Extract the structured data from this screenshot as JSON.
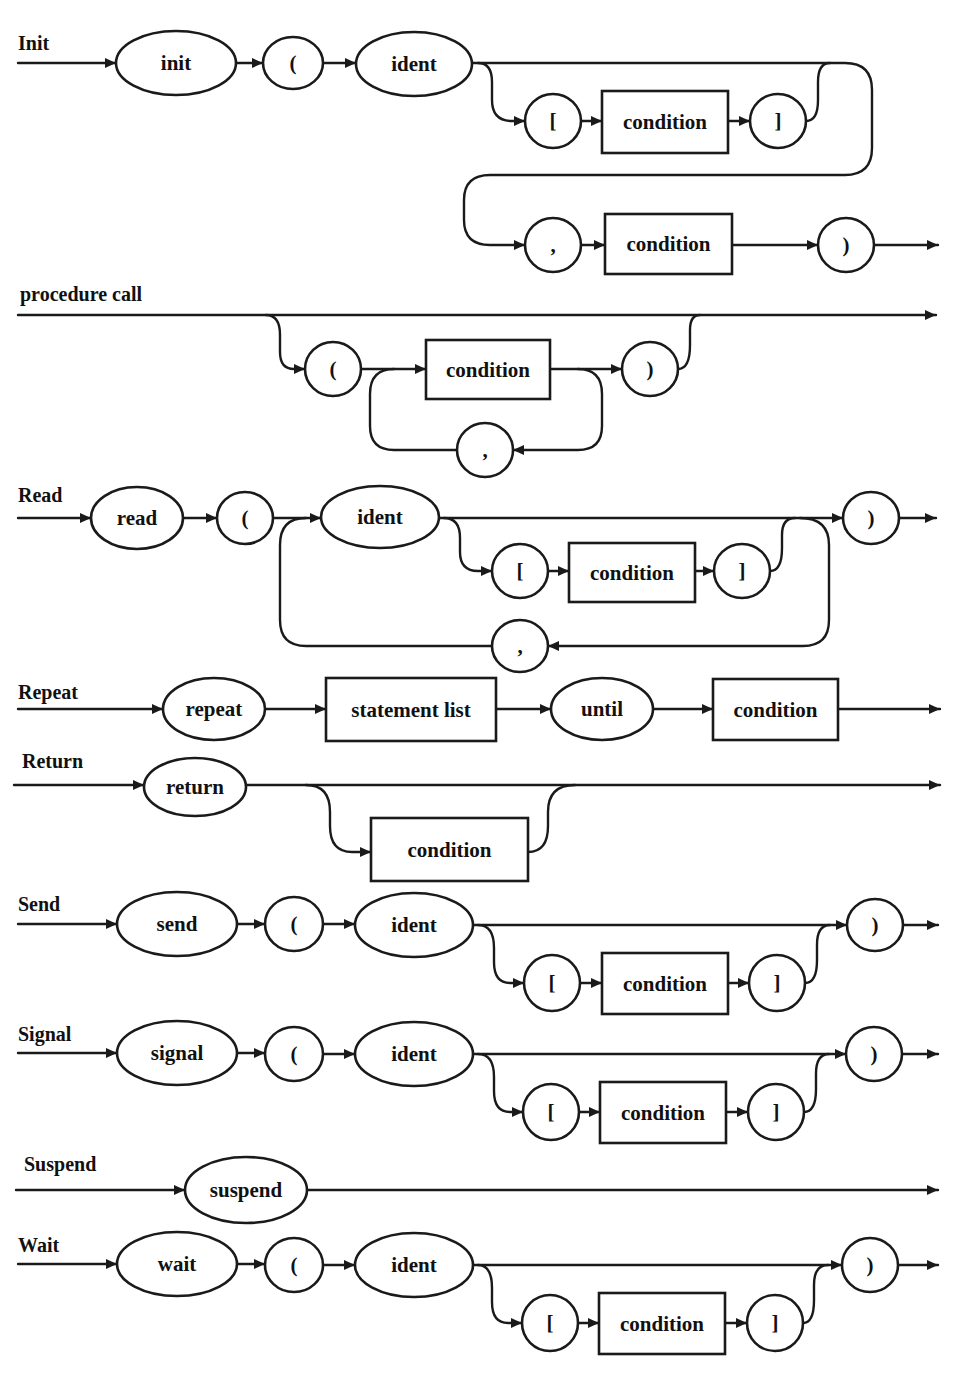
{
  "diagram": {
    "title": "Syntax diagrams for statements",
    "colors": {
      "ink": "#1a1a1a",
      "background": "#ffffff"
    },
    "rules": [
      {
        "id": "init",
        "title": "Init",
        "title_pos": [
          18,
          50
        ]
      },
      {
        "id": "procedure-call",
        "title": "procedure call",
        "title_pos": [
          20,
          301
        ]
      },
      {
        "id": "read",
        "title": "Read",
        "title_pos": [
          18,
          502
        ]
      },
      {
        "id": "repeat",
        "title": "Repeat",
        "title_pos": [
          18,
          699
        ]
      },
      {
        "id": "return",
        "title": "Return",
        "title_pos": [
          22,
          768
        ]
      },
      {
        "id": "send",
        "title": "Send",
        "title_pos": [
          18,
          911
        ]
      },
      {
        "id": "signal",
        "title": "Signal",
        "title_pos": [
          18,
          1041
        ]
      },
      {
        "id": "suspend",
        "title": "Suspend",
        "title_pos": [
          24,
          1171
        ]
      },
      {
        "id": "wait",
        "title": "Wait",
        "title_pos": [
          18,
          1252
        ]
      }
    ],
    "nodes": [
      {
        "rule": "init",
        "kind": "terminal",
        "label": "init",
        "cx": 176,
        "cy": 63,
        "rx": 60,
        "ry": 32
      },
      {
        "rule": "init",
        "kind": "terminal",
        "label": "(",
        "cx": 293,
        "cy": 63,
        "rx": 30,
        "ry": 26
      },
      {
        "rule": "init",
        "kind": "terminal",
        "label": "ident",
        "cx": 414,
        "cy": 64,
        "rx": 58,
        "ry": 32
      },
      {
        "rule": "init",
        "kind": "terminal",
        "label": "[",
        "cx": 553,
        "cy": 121,
        "rx": 28,
        "ry": 27
      },
      {
        "rule": "init",
        "kind": "nonterminal",
        "label": "condition",
        "x": 602,
        "y": 91,
        "w": 126,
        "h": 62
      },
      {
        "rule": "init",
        "kind": "terminal",
        "label": "]",
        "cx": 778,
        "cy": 121,
        "rx": 28,
        "ry": 27
      },
      {
        "rule": "init",
        "kind": "terminal",
        "label": ",",
        "cx": 553,
        "cy": 245,
        "rx": 28,
        "ry": 27
      },
      {
        "rule": "init",
        "kind": "nonterminal",
        "label": "condition",
        "x": 605,
        "y": 214,
        "w": 127,
        "h": 60
      },
      {
        "rule": "init",
        "kind": "terminal",
        "label": ")",
        "cx": 846,
        "cy": 245,
        "rx": 28,
        "ry": 27
      },
      {
        "rule": "procedure-call",
        "kind": "terminal",
        "label": "(",
        "cx": 333,
        "cy": 369,
        "rx": 28,
        "ry": 27
      },
      {
        "rule": "procedure-call",
        "kind": "nonterminal",
        "label": "condition",
        "x": 426,
        "y": 340,
        "w": 124,
        "h": 59
      },
      {
        "rule": "procedure-call",
        "kind": "terminal",
        "label": ")",
        "cx": 650,
        "cy": 369,
        "rx": 28,
        "ry": 27
      },
      {
        "rule": "procedure-call",
        "kind": "terminal",
        "label": ",",
        "cx": 485,
        "cy": 450,
        "rx": 28,
        "ry": 27
      },
      {
        "rule": "read",
        "kind": "terminal",
        "label": "read",
        "cx": 137,
        "cy": 518,
        "rx": 46,
        "ry": 31
      },
      {
        "rule": "read",
        "kind": "terminal",
        "label": "(",
        "cx": 245,
        "cy": 518,
        "rx": 28,
        "ry": 26
      },
      {
        "rule": "read",
        "kind": "terminal",
        "label": "ident",
        "cx": 380,
        "cy": 517,
        "rx": 59,
        "ry": 31
      },
      {
        "rule": "read",
        "kind": "terminal",
        "label": "[",
        "cx": 520,
        "cy": 571,
        "rx": 28,
        "ry": 27
      },
      {
        "rule": "read",
        "kind": "nonterminal",
        "label": "condition",
        "x": 569,
        "y": 543,
        "w": 126,
        "h": 59
      },
      {
        "rule": "read",
        "kind": "terminal",
        "label": "]",
        "cx": 742,
        "cy": 571,
        "rx": 28,
        "ry": 27
      },
      {
        "rule": "read",
        "kind": "terminal",
        "label": ",",
        "cx": 520,
        "cy": 646,
        "rx": 28,
        "ry": 26
      },
      {
        "rule": "read",
        "kind": "terminal",
        "label": ")",
        "cx": 871,
        "cy": 518,
        "rx": 28,
        "ry": 26
      },
      {
        "rule": "repeat",
        "kind": "terminal",
        "label": "repeat",
        "cx": 214,
        "cy": 709,
        "rx": 51,
        "ry": 31
      },
      {
        "rule": "repeat",
        "kind": "nonterminal",
        "label": "statement list",
        "x": 326,
        "y": 678,
        "w": 170,
        "h": 63
      },
      {
        "rule": "repeat",
        "kind": "terminal",
        "label": "until",
        "cx": 602,
        "cy": 709,
        "rx": 51,
        "ry": 31
      },
      {
        "rule": "repeat",
        "kind": "nonterminal",
        "label": "condition",
        "x": 713,
        "y": 679,
        "w": 125,
        "h": 61
      },
      {
        "rule": "return",
        "kind": "terminal",
        "label": "return",
        "cx": 195,
        "cy": 787,
        "rx": 51,
        "ry": 29
      },
      {
        "rule": "return",
        "kind": "nonterminal",
        "label": "condition",
        "x": 371,
        "y": 818,
        "w": 157,
        "h": 63
      },
      {
        "rule": "send",
        "kind": "terminal",
        "label": "send",
        "cx": 177,
        "cy": 924,
        "rx": 60,
        "ry": 32
      },
      {
        "rule": "send",
        "kind": "terminal",
        "label": "(",
        "cx": 294,
        "cy": 924,
        "rx": 29,
        "ry": 27
      },
      {
        "rule": "send",
        "kind": "terminal",
        "label": "ident",
        "cx": 414,
        "cy": 925,
        "rx": 59,
        "ry": 32
      },
      {
        "rule": "send",
        "kind": "terminal",
        "label": "[",
        "cx": 552,
        "cy": 983,
        "rx": 28,
        "ry": 28
      },
      {
        "rule": "send",
        "kind": "nonterminal",
        "label": "condition",
        "x": 602,
        "y": 953,
        "w": 126,
        "h": 61
      },
      {
        "rule": "send",
        "kind": "terminal",
        "label": "]",
        "cx": 777,
        "cy": 983,
        "rx": 28,
        "ry": 28
      },
      {
        "rule": "send",
        "kind": "terminal",
        "label": ")",
        "cx": 875,
        "cy": 925,
        "rx": 28,
        "ry": 26
      },
      {
        "rule": "signal",
        "kind": "terminal",
        "label": "signal",
        "cx": 177,
        "cy": 1053,
        "rx": 60,
        "ry": 32
      },
      {
        "rule": "signal",
        "kind": "terminal",
        "label": "(",
        "cx": 294,
        "cy": 1054,
        "rx": 29,
        "ry": 27
      },
      {
        "rule": "signal",
        "kind": "terminal",
        "label": "ident",
        "cx": 414,
        "cy": 1054,
        "rx": 59,
        "ry": 32
      },
      {
        "rule": "signal",
        "kind": "terminal",
        "label": "[",
        "cx": 551,
        "cy": 1112,
        "rx": 28,
        "ry": 28
      },
      {
        "rule": "signal",
        "kind": "nonterminal",
        "label": "condition",
        "x": 600,
        "y": 1082,
        "w": 126,
        "h": 61
      },
      {
        "rule": "signal",
        "kind": "terminal",
        "label": "]",
        "cx": 776,
        "cy": 1112,
        "rx": 28,
        "ry": 28
      },
      {
        "rule": "signal",
        "kind": "terminal",
        "label": ")",
        "cx": 874,
        "cy": 1054,
        "rx": 28,
        "ry": 27
      },
      {
        "rule": "suspend",
        "kind": "terminal",
        "label": "suspend",
        "cx": 246,
        "cy": 1190,
        "rx": 61,
        "ry": 33
      },
      {
        "rule": "wait",
        "kind": "terminal",
        "label": "wait",
        "cx": 177,
        "cy": 1264,
        "rx": 60,
        "ry": 32
      },
      {
        "rule": "wait",
        "kind": "terminal",
        "label": "(",
        "cx": 294,
        "cy": 1265,
        "rx": 29,
        "ry": 27
      },
      {
        "rule": "wait",
        "kind": "terminal",
        "label": "ident",
        "cx": 414,
        "cy": 1265,
        "rx": 59,
        "ry": 32
      },
      {
        "rule": "wait",
        "kind": "terminal",
        "label": "[",
        "cx": 550,
        "cy": 1323,
        "rx": 28,
        "ry": 28
      },
      {
        "rule": "wait",
        "kind": "nonterminal",
        "label": "condition",
        "x": 599,
        "y": 1293,
        "w": 126,
        "h": 61
      },
      {
        "rule": "wait",
        "kind": "terminal",
        "label": "]",
        "cx": 775,
        "cy": 1323,
        "rx": 28,
        "ry": 28
      },
      {
        "rule": "wait",
        "kind": "terminal",
        "label": ")",
        "cx": 870,
        "cy": 1265,
        "rx": 28,
        "ry": 27
      }
    ],
    "paths": [
      {
        "rule": "init",
        "d": "M18 63 L116 63",
        "arrow": [
          116,
          63,
          "r"
        ]
      },
      {
        "rule": "init",
        "d": "M236 63 L263 63",
        "arrow": [
          263,
          63,
          "r"
        ]
      },
      {
        "rule": "init",
        "d": "M323 63 L356 63",
        "arrow": [
          356,
          63,
          "r"
        ]
      },
      {
        "rule": "init",
        "d": "M472 63 L845 63 Q872 63 872 90 L872 148 Q872 175 845 175 L490 175 Q464 175 464 200 L464 220 Q464 245 490 245 L525 245",
        "arrow": [
          525,
          245,
          "r"
        ]
      },
      {
        "rule": "init",
        "d": "M478 63 Q492 63 492 82 L492 100 Q492 121 512 121 L525 121",
        "arrow": [
          525,
          121,
          "r"
        ]
      },
      {
        "rule": "init",
        "d": "M581 121 L602 121",
        "arrow": [
          602,
          121,
          "r"
        ]
      },
      {
        "rule": "init",
        "d": "M728 121 L750 121",
        "arrow": [
          750,
          121,
          "r"
        ]
      },
      {
        "rule": "init",
        "d": "M806 121 Q818 121 818 100 L818 82 Q818 63 830 63"
      },
      {
        "rule": "init",
        "d": "M581 245 L605 245",
        "arrow": [
          605,
          245,
          "r"
        ]
      },
      {
        "rule": "init",
        "d": "M732 245 L818 245",
        "arrow": [
          818,
          245,
          "r"
        ]
      },
      {
        "rule": "init",
        "d": "M874 245 L938 245",
        "arrow": [
          938,
          245,
          "r"
        ]
      },
      {
        "rule": "procedure-call",
        "d": "M18 315 L936 315",
        "arrow": [
          936,
          315,
          "r"
        ]
      },
      {
        "rule": "procedure-call",
        "d": "M266 315 Q280 315 280 335 L280 352 Q280 369 294 369 L305 369",
        "arrow": [
          305,
          369,
          "r"
        ]
      },
      {
        "rule": "procedure-call",
        "d": "M361 369 L426 369",
        "arrow": [
          426,
          369,
          "r"
        ]
      },
      {
        "rule": "procedure-call",
        "d": "M394 369 Q370 369 370 394 L370 426 Q370 450 394 450 L457 450"
      },
      {
        "rule": "procedure-call",
        "d": "M550 369 L622 369",
        "arrow": [
          622,
          369,
          "r"
        ]
      },
      {
        "rule": "procedure-call",
        "d": "M578 369 Q602 369 602 394 L602 426 Q602 450 578 450 L513 450",
        "arrow": [
          513,
          450,
          "l"
        ]
      },
      {
        "rule": "procedure-call",
        "d": "M678 369 Q690 369 690 345 L690 330 Q690 315 700 315"
      },
      {
        "rule": "read",
        "d": "M18 518 L91 518",
        "arrow": [
          91,
          518,
          "r"
        ]
      },
      {
        "rule": "read",
        "d": "M183 518 L217 518",
        "arrow": [
          217,
          518,
          "r"
        ]
      },
      {
        "rule": "read",
        "d": "M273 518 L321 518",
        "arrow": [
          321,
          518,
          "r"
        ]
      },
      {
        "rule": "read",
        "d": "M439 518 L843 518",
        "arrow": [
          843,
          518,
          "r"
        ]
      },
      {
        "rule": "read",
        "d": "M444 518 Q460 518 460 538 L460 552 Q460 571 478 571 L492 571",
        "arrow": [
          492,
          571,
          "r"
        ]
      },
      {
        "rule": "read",
        "d": "M548 571 L569 571",
        "arrow": [
          569,
          571,
          "r"
        ]
      },
      {
        "rule": "read",
        "d": "M695 571 L714 571",
        "arrow": [
          714,
          571,
          "r"
        ]
      },
      {
        "rule": "read",
        "d": "M770 571 Q782 571 782 548 L782 535 Q782 518 795 518"
      },
      {
        "rule": "read",
        "d": "M800 518 Q829 518 829 545 L829 620 Q829 646 803 646 L548 646",
        "arrow": [
          548,
          646,
          "l"
        ]
      },
      {
        "rule": "read",
        "d": "M492 646 L306 646 Q280 646 280 620 L280 545 Q280 518 306 518"
      },
      {
        "rule": "read",
        "d": "M899 518 L936 518",
        "arrow": [
          936,
          518,
          "r"
        ]
      },
      {
        "rule": "repeat",
        "d": "M18 709 L163 709",
        "arrow": [
          163,
          709,
          "r"
        ]
      },
      {
        "rule": "repeat",
        "d": "M265 709 L326 709",
        "arrow": [
          326,
          709,
          "r"
        ]
      },
      {
        "rule": "repeat",
        "d": "M496 709 L551 709",
        "arrow": [
          551,
          709,
          "r"
        ]
      },
      {
        "rule": "repeat",
        "d": "M653 709 L713 709",
        "arrow": [
          713,
          709,
          "r"
        ]
      },
      {
        "rule": "repeat",
        "d": "M838 709 L940 709",
        "arrow": [
          940,
          709,
          "r"
        ]
      },
      {
        "rule": "return",
        "d": "M14 785 L144 785",
        "arrow": [
          144,
          785,
          "r"
        ]
      },
      {
        "rule": "return",
        "d": "M246 785 L940 785",
        "arrow": [
          940,
          785,
          "r"
        ]
      },
      {
        "rule": "return",
        "d": "M306 785 Q330 785 330 812 L330 826 Q330 852 352 852 L371 852",
        "arrow": [
          371,
          852,
          "r"
        ]
      },
      {
        "rule": "return",
        "d": "M528 852 Q548 852 548 826 L548 812 Q548 785 575 785"
      },
      {
        "rule": "send",
        "d": "M18 924 L117 924",
        "arrow": [
          117,
          924,
          "r"
        ]
      },
      {
        "rule": "send",
        "d": "M237 924 L265 924",
        "arrow": [
          265,
          924,
          "r"
        ]
      },
      {
        "rule": "send",
        "d": "M323 924 L355 924",
        "arrow": [
          355,
          924,
          "r"
        ]
      },
      {
        "rule": "send",
        "d": "M473 925 L847 925",
        "arrow": [
          847,
          925,
          "r"
        ]
      },
      {
        "rule": "send",
        "d": "M478 925 Q494 925 494 948 L494 962 Q494 983 510 983 L524 983",
        "arrow": [
          524,
          983,
          "r"
        ]
      },
      {
        "rule": "send",
        "d": "M580 983 L602 983",
        "arrow": [
          602,
          983,
          "r"
        ]
      },
      {
        "rule": "send",
        "d": "M728 983 L749 983",
        "arrow": [
          749,
          983,
          "r"
        ]
      },
      {
        "rule": "send",
        "d": "M805 983 Q817 983 817 960 L817 945 Q817 925 830 925"
      },
      {
        "rule": "send",
        "d": "M903 925 L938 925",
        "arrow": [
          938,
          925,
          "r"
        ]
      },
      {
        "rule": "signal",
        "d": "M18 1053 L117 1053",
        "arrow": [
          117,
          1053,
          "r"
        ]
      },
      {
        "rule": "signal",
        "d": "M237 1053 L265 1053",
        "arrow": [
          265,
          1053,
          "r"
        ]
      },
      {
        "rule": "signal",
        "d": "M323 1054 L355 1054",
        "arrow": [
          355,
          1054,
          "r"
        ]
      },
      {
        "rule": "signal",
        "d": "M473 1054 L846 1054",
        "arrow": [
          846,
          1054,
          "r"
        ]
      },
      {
        "rule": "signal",
        "d": "M478 1054 Q494 1054 494 1077 L494 1091 Q494 1112 510 1112 L523 1112",
        "arrow": [
          523,
          1112,
          "r"
        ]
      },
      {
        "rule": "signal",
        "d": "M579 1112 L600 1112",
        "arrow": [
          600,
          1112,
          "r"
        ]
      },
      {
        "rule": "signal",
        "d": "M726 1112 L748 1112",
        "arrow": [
          748,
          1112,
          "r"
        ]
      },
      {
        "rule": "signal",
        "d": "M804 1112 Q816 1112 816 1089 L816 1074 Q816 1054 829 1054"
      },
      {
        "rule": "signal",
        "d": "M902 1054 L938 1054",
        "arrow": [
          938,
          1054,
          "r"
        ]
      },
      {
        "rule": "suspend",
        "d": "M16 1190 L185 1190",
        "arrow": [
          185,
          1190,
          "r"
        ]
      },
      {
        "rule": "suspend",
        "d": "M307 1190 L938 1190",
        "arrow": [
          938,
          1190,
          "r"
        ]
      },
      {
        "rule": "wait",
        "d": "M18 1264 L117 1264",
        "arrow": [
          117,
          1264,
          "r"
        ]
      },
      {
        "rule": "wait",
        "d": "M237 1264 L265 1264",
        "arrow": [
          265,
          1264,
          "r"
        ]
      },
      {
        "rule": "wait",
        "d": "M323 1265 L355 1265",
        "arrow": [
          355,
          1265,
          "r"
        ]
      },
      {
        "rule": "wait",
        "d": "M473 1265 L842 1265",
        "arrow": [
          842,
          1265,
          "r"
        ]
      },
      {
        "rule": "wait",
        "d": "M478 1265 Q492 1265 492 1288 L492 1302 Q492 1323 508 1323 L522 1323",
        "arrow": [
          522,
          1323,
          "r"
        ]
      },
      {
        "rule": "wait",
        "d": "M578 1323 L599 1323",
        "arrow": [
          599,
          1323,
          "r"
        ]
      },
      {
        "rule": "wait",
        "d": "M725 1323 L747 1323",
        "arrow": [
          747,
          1323,
          "r"
        ]
      },
      {
        "rule": "wait",
        "d": "M803 1323 Q814 1323 814 1300 L814 1285 Q814 1265 828 1265"
      },
      {
        "rule": "wait",
        "d": "M898 1265 L938 1265",
        "arrow": [
          938,
          1265,
          "r"
        ]
      }
    ]
  }
}
